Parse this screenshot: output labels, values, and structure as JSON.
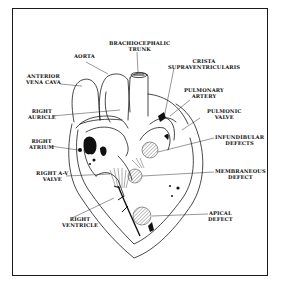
{
  "diagram": {
    "labels": {
      "brachiocephalic_trunk": "BRACHIOCEPHALIC\nTRUNK",
      "aorta": "AORTA",
      "crista_supraventricularis": "CRISTA\nSUPRAVENTRICULARIS",
      "anterior_vena_cava": "ANTERIOR\nVENA CAVA",
      "pulmonary_artery": "PULMONARY\nARTERY",
      "right_auricle": "RIGHT\nAURICLE",
      "pulmonic_valve": "PULMONIC\nVALVE",
      "right_atrium": "RIGHT\nATRIUM",
      "infundibular_defects": "INFUNDIBULAR\nDEFECTS",
      "right_av_valve": "RIGHT A-V\nVALVE",
      "membranous_defect": "MEMBRANEOUS\nDEFECT",
      "right_ventricle": "RIGHT\nVENTRICLE",
      "apical_defect": "APICAL\nDEFECT"
    },
    "colors": {
      "line": "#1a1a1a",
      "background": "#ffffff",
      "fill": "#111111"
    }
  }
}
